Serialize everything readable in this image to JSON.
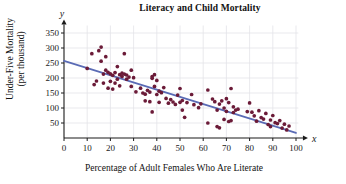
{
  "chart_data": {
    "type": "scatter",
    "title": "Literacy and Child Mortality",
    "xlabel": "Percentage of Adult Females Who Are Literate",
    "ylabel_line1": "Under-Five Mortality",
    "ylabel_line2": "(per thousand)",
    "x_axis_symbol": "x",
    "y_axis_symbol": "y",
    "xlim": [
      0,
      100
    ],
    "ylim": [
      0,
      375
    ],
    "xticks": [
      0,
      10,
      20,
      30,
      40,
      50,
      60,
      70,
      80,
      90,
      100
    ],
    "yticks": [
      50,
      100,
      150,
      200,
      250,
      300,
      350
    ],
    "grid": true,
    "legend": "none",
    "point_color": "#6b1b38",
    "line_color": "#5a6bb5",
    "axis_color": "#1a1a1a",
    "grid_color": "#e3e3e8",
    "trendline": {
      "name": "least-squares regression line",
      "x": [
        0,
        100
      ],
      "y": [
        257,
        17
      ]
    },
    "points": [
      [
        10,
        232
      ],
      [
        12,
        281
      ],
      [
        13,
        178
      ],
      [
        14,
        190
      ],
      [
        15,
        291
      ],
      [
        16,
        303
      ],
      [
        16,
        256
      ],
      [
        17,
        213
      ],
      [
        17,
        183
      ],
      [
        18,
        271
      ],
      [
        18,
        226
      ],
      [
        19,
        219
      ],
      [
        19,
        166
      ],
      [
        20,
        214
      ],
      [
        20,
        189
      ],
      [
        21,
        209
      ],
      [
        21,
        163
      ],
      [
        22,
        218
      ],
      [
        22,
        183
      ],
      [
        23,
        238
      ],
      [
        23,
        196
      ],
      [
        24,
        211
      ],
      [
        24,
        174
      ],
      [
        25,
        216
      ],
      [
        25,
        205
      ],
      [
        26,
        281
      ],
      [
        26,
        213
      ],
      [
        27,
        210
      ],
      [
        27,
        196
      ],
      [
        28,
        203
      ],
      [
        29,
        226
      ],
      [
        29,
        172
      ],
      [
        30,
        201
      ],
      [
        31,
        154
      ],
      [
        33,
        166
      ],
      [
        34,
        150
      ],
      [
        35,
        146
      ],
      [
        35,
        124
      ],
      [
        36,
        159
      ],
      [
        37,
        153
      ],
      [
        37,
        121
      ],
      [
        38,
        205
      ],
      [
        38,
        199
      ],
      [
        38,
        87
      ],
      [
        39,
        211
      ],
      [
        39,
        172
      ],
      [
        40,
        192
      ],
      [
        40,
        145
      ],
      [
        41,
        156
      ],
      [
        41,
        119
      ],
      [
        42,
        151
      ],
      [
        43,
        168
      ],
      [
        44,
        132
      ],
      [
        45,
        116
      ],
      [
        46,
        128
      ],
      [
        47,
        120
      ],
      [
        48,
        112
      ],
      [
        49,
        143
      ],
      [
        50,
        165
      ],
      [
        50,
        119
      ],
      [
        51,
        125
      ],
      [
        51,
        93
      ],
      [
        52,
        69
      ],
      [
        53,
        118
      ],
      [
        55,
        145
      ],
      [
        56,
        111
      ],
      [
        58,
        101
      ],
      [
        59,
        114
      ],
      [
        62,
        160
      ],
      [
        62,
        50
      ],
      [
        64,
        130
      ],
      [
        65,
        121
      ],
      [
        66,
        93
      ],
      [
        66,
        38
      ],
      [
        67,
        113
      ],
      [
        67,
        34
      ],
      [
        68,
        124
      ],
      [
        69,
        62
      ],
      [
        69,
        100
      ],
      [
        70,
        131
      ],
      [
        70,
        89
      ],
      [
        71,
        118
      ],
      [
        71,
        55
      ],
      [
        72,
        165
      ],
      [
        72,
        58
      ],
      [
        73,
        104
      ],
      [
        73,
        85
      ],
      [
        74,
        93
      ],
      [
        75,
        96
      ],
      [
        79,
        88
      ],
      [
        80,
        117
      ],
      [
        81,
        86
      ],
      [
        82,
        74
      ],
      [
        83,
        56
      ],
      [
        84,
        91
      ],
      [
        85,
        68
      ],
      [
        86,
        63
      ],
      [
        87,
        82
      ],
      [
        88,
        45
      ],
      [
        89,
        60
      ],
      [
        89,
        38
      ],
      [
        90,
        75
      ],
      [
        91,
        51
      ],
      [
        92,
        48
      ],
      [
        93,
        58
      ],
      [
        94,
        33
      ],
      [
        95,
        46
      ],
      [
        96,
        27
      ],
      [
        97,
        40
      ]
    ]
  }
}
